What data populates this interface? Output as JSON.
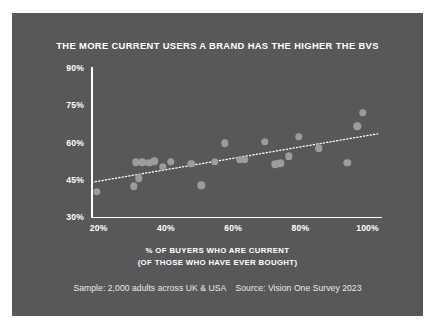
{
  "figure": {
    "background_color": "#57585a",
    "page_background_color": "#ffffff",
    "title": "THE MORE CURRENT USERS A BRAND HAS THE HIGHER THE BVS",
    "footer": "Sample: 2,000 adults across UK & USA    Source: Vision One Survey 2023",
    "xlabel_line1": "% OF BUYERS WHO ARE CURRENT",
    "xlabel_line2": "(OF THOSE WHO HAVE EVER BOUGHT)",
    "ylabel": "BRAND VELOCITY SCORE (BVS)"
  },
  "chart_data": {
    "type": "scatter",
    "title": "THE MORE CURRENT USERS A BRAND HAS THE HIGHER THE BVS",
    "xlabel": "% OF BUYERS WHO ARE CURRENT (OF THOSE WHO HAVE EVER BOUGHT)",
    "ylabel": "BRAND VELOCITY SCORE (BVS)",
    "xlim": [
      18,
      104
    ],
    "ylim": [
      30,
      90
    ],
    "xticks": [
      20,
      40,
      60,
      80,
      100
    ],
    "xtick_labels": [
      "20%",
      "40%",
      "60%",
      "80%",
      "100%"
    ],
    "yticks": [
      30,
      45,
      60,
      75,
      90
    ],
    "ytick_labels": [
      "30%",
      "45%",
      "60%",
      "75%",
      "90%"
    ],
    "grid": false,
    "legend": "none",
    "marker_color": "#9b9c9e",
    "axis_color": "#ffffff",
    "text_color": "#ffffff",
    "points": [
      {
        "x": 19.5,
        "y": 40.2
      },
      {
        "x": 30.5,
        "y": 42.3
      },
      {
        "x": 31.0,
        "y": 52.0
      },
      {
        "x": 32.0,
        "y": 45.6
      },
      {
        "x": 33.0,
        "y": 52.0
      },
      {
        "x": 35.0,
        "y": 51.8
      },
      {
        "x": 36.5,
        "y": 52.4
      },
      {
        "x": 39.0,
        "y": 50.2
      },
      {
        "x": 41.5,
        "y": 52.2
      },
      {
        "x": 47.5,
        "y": 51.5
      },
      {
        "x": 50.5,
        "y": 42.8
      },
      {
        "x": 54.5,
        "y": 52.2
      },
      {
        "x": 57.5,
        "y": 59.6
      },
      {
        "x": 62.0,
        "y": 53.0
      },
      {
        "x": 63.5,
        "y": 53.0
      },
      {
        "x": 69.5,
        "y": 60.4
      },
      {
        "x": 72.5,
        "y": 51.2
      },
      {
        "x": 74.0,
        "y": 51.6
      },
      {
        "x": 76.5,
        "y": 54.5
      },
      {
        "x": 79.5,
        "y": 62.3
      },
      {
        "x": 85.5,
        "y": 57.6
      },
      {
        "x": 94.0,
        "y": 51.8
      },
      {
        "x": 97.0,
        "y": 66.5
      },
      {
        "x": 98.5,
        "y": 72.0
      }
    ],
    "trendline": {
      "style": "dotted",
      "color": "#ffffff",
      "x_start": 18,
      "y_start": 44.0,
      "x_end": 103,
      "y_end": 63.5
    }
  }
}
